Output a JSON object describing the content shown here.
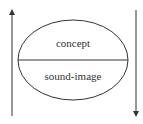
{
  "diagram": {
    "ellipse": {
      "upper_label": "concept",
      "lower_label": "sound-image"
    },
    "arrows": [
      {
        "name": "left-arrow",
        "direction": "up"
      },
      {
        "name": "right-arrow",
        "direction": "down"
      }
    ],
    "colors": {
      "stroke": "#333333",
      "text": "#333333",
      "background": "#ffffff"
    }
  }
}
